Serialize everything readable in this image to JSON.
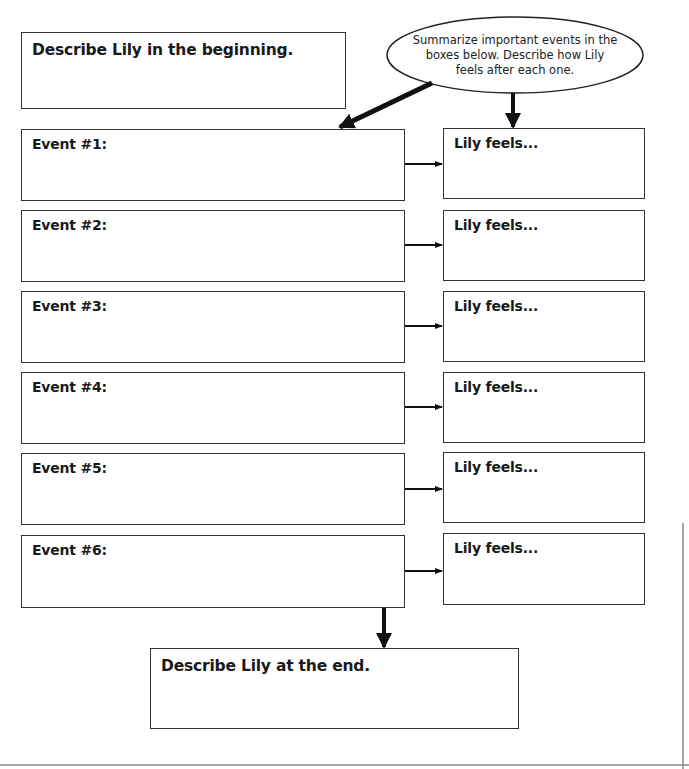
{
  "worksheet": {
    "beginning_box": {
      "label": "Describe Lily in the beginning."
    },
    "instruction_bubble": {
      "text": "Summarize important events in the boxes below. Describe how Lily feels after each one."
    },
    "events": [
      {
        "label": "Event #1:",
        "feeling_label": "Lily feels..."
      },
      {
        "label": "Event #2:",
        "feeling_label": "Lily feels..."
      },
      {
        "label": "Event #3:",
        "feeling_label": "Lily feels..."
      },
      {
        "label": "Event #4:",
        "feeling_label": "Lily feels..."
      },
      {
        "label": "Event #5:",
        "feeling_label": "Lily feels..."
      },
      {
        "label": "Event #6:",
        "feeling_label": "Lily feels..."
      }
    ],
    "end_box": {
      "label": "Describe Lily at the end."
    }
  },
  "colors": {
    "line": "#333333",
    "arrow": "#111111",
    "background": "#ffffff",
    "rule": "#888888"
  }
}
